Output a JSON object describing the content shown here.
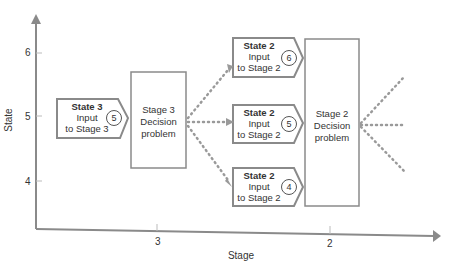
{
  "diagram": {
    "y_axis": {
      "label": "State",
      "ticks": [
        "6",
        "5",
        "4"
      ]
    },
    "x_axis": {
      "label": "Stage",
      "ticks": [
        "3",
        "2"
      ]
    },
    "input_stage3": {
      "title": "State 3",
      "line1": "Input",
      "line2": "to Stage 3",
      "number": "5"
    },
    "decision_stage3": {
      "line1": "Stage 3",
      "line2": "Decision",
      "line3": "problem"
    },
    "inputs_stage2": [
      {
        "title": "State 2",
        "line1": "Input",
        "line2": "to Stage 2",
        "number": "6"
      },
      {
        "title": "State 2",
        "line1": "Input",
        "line2": "to Stage 2",
        "number": "5"
      },
      {
        "title": "State 2",
        "line1": "Input",
        "line2": "to Stage 2",
        "number": "4"
      }
    ],
    "decision_stage2": {
      "line1": "Stage 2",
      "line2": "Decision",
      "line3": "problem"
    },
    "colors": {
      "line": "#8a8a8a",
      "dots": "#9a9a9a",
      "text": "#333333"
    }
  }
}
